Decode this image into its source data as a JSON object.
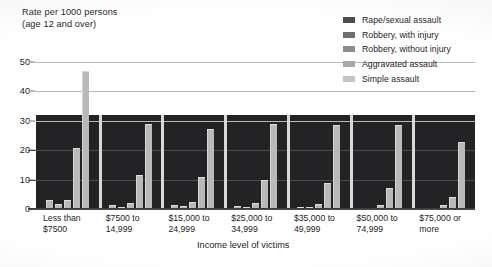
{
  "chart_data": {
    "type": "bar",
    "title": "Rate per 1000 persons\n(age 12 and over)",
    "ylabel": "Rate per 1000 persons (age 12 and over)",
    "xlabel": "Income level of victims",
    "ylim": [
      0,
      50
    ],
    "yticks": [
      0,
      10,
      20,
      30,
      40,
      50
    ],
    "grid": true,
    "legend_position": "top-right",
    "categories": [
      "Less than\n$7500",
      "$7500 to\n14,999",
      "$15,000 to\n24,999",
      "$25,000 to\n34,999",
      "$35,000 to\n49,999",
      "$50,000 to\n74,999",
      "$75,000 or\nmore"
    ],
    "series": [
      {
        "name": "Rape/sexual assault",
        "color": "#4c4c4c",
        "values": [
          3.2,
          1.4,
          1.2,
          0.9,
          0.7,
          0.5,
          0.4
        ]
      },
      {
        "name": "Robbery, with injury",
        "color": "#6e6e6e",
        "values": [
          1.8,
          0.8,
          0.9,
          0.7,
          0.6,
          0.5,
          0.4
        ]
      },
      {
        "name": "Robbery, without injury",
        "color": "#8c8c8c",
        "values": [
          3.1,
          2.2,
          2.3,
          1.9,
          1.7,
          1.5,
          1.3
        ]
      },
      {
        "name": "Aggravated assault",
        "color": "#a8a8a8",
        "values": [
          20.8,
          11.6,
          11.0,
          9.8,
          8.9,
          7.2,
          4.0
        ]
      },
      {
        "name": "Simple assault",
        "color": "#c4c4c4",
        "values": [
          47.0,
          29.0,
          27.2,
          28.9,
          28.7,
          28.6,
          22.8
        ]
      }
    ]
  },
  "xaxis_title": "Income level of victims"
}
